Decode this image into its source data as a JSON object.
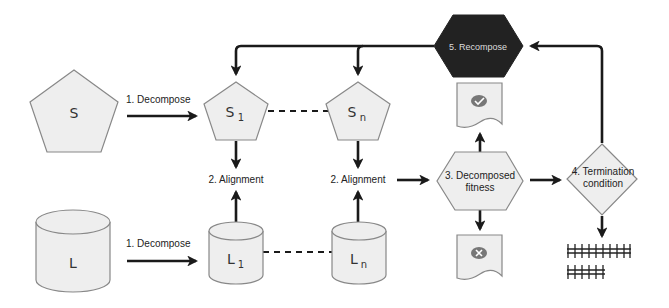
{
  "diagram": {
    "nodes": {
      "S": {
        "label": "S",
        "shape": "pentagon"
      },
      "S1": {
        "label": "S",
        "subscript": "1",
        "shape": "pentagon"
      },
      "Sn": {
        "label": "S",
        "subscript": "n",
        "shape": "pentagon"
      },
      "L": {
        "label": "L",
        "shape": "cylinder"
      },
      "L1": {
        "label": "L",
        "subscript": "1",
        "shape": "cylinder"
      },
      "Ln": {
        "label": "L",
        "subscript": "n",
        "shape": "cylinder"
      },
      "recompose": {
        "label": "5. Recompose",
        "shape": "hexagon",
        "fill": "#222222"
      },
      "fitness": {
        "line1": "3. Decomposed",
        "line2": "fitness",
        "shape": "hexagon"
      },
      "termination": {
        "line1": "4. Termination",
        "line2": "condition",
        "shape": "diamond"
      },
      "doc_pass": {
        "icon": "check-icon",
        "shape": "document"
      },
      "doc_fail": {
        "icon": "cross-icon",
        "shape": "document"
      },
      "tally": {
        "icon": "tally-marks-icon",
        "row1_count": 10,
        "row2_count": 6
      }
    },
    "edges": {
      "decompose_s": "1. Decompose",
      "decompose_l": "1. Decompose",
      "alignment_1": "2. Alignment",
      "alignment_n": "2. Alignment"
    },
    "colors": {
      "shape_fill": "#eeeeee",
      "shape_stroke": "#888888",
      "edge": "#1a1a1a",
      "recompose_fill": "#222222",
      "recompose_text": "#dddddd",
      "icon_fill": "#777777"
    }
  }
}
